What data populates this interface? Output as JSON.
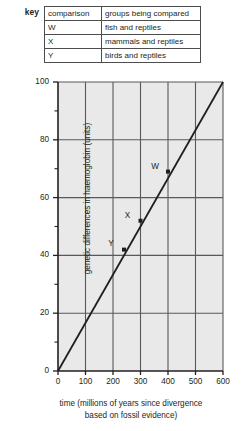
{
  "key": {
    "label": "key",
    "headers": [
      "comparison",
      "groups being compared"
    ],
    "rows": [
      {
        "comparison": "W",
        "groups": "fish and reptiles"
      },
      {
        "comparison": "X",
        "groups": "mammals and reptiles"
      },
      {
        "comparison": "Y",
        "groups": "birds and reptiles"
      }
    ]
  },
  "chart_data": {
    "type": "line",
    "title": "",
    "xlabel": "time (millions of years since divergence based on fossil evidence)",
    "xlabel_line1": "time (millions of years since divergence",
    "xlabel_line2": "based on fossil evidence)",
    "ylabel": "genetic differences in haemoglobin (units)",
    "xlim": [
      0,
      600
    ],
    "ylim": [
      0,
      100
    ],
    "xticks": [
      0,
      100,
      200,
      300,
      400,
      500,
      600
    ],
    "yticks": [
      0,
      20,
      40,
      60,
      80,
      100
    ],
    "y_minor_ticks": [
      10,
      30,
      50,
      70,
      90
    ],
    "grid": true,
    "legend_position": "above-plot",
    "series": [
      {
        "name": "best fit line",
        "x": [
          0,
          600
        ],
        "values": [
          0,
          100
        ]
      }
    ],
    "annotations": [
      {
        "label": "W",
        "x": 400,
        "y": 69,
        "label_offset_x": -13,
        "label_offset_y": -6
      },
      {
        "label": "X",
        "x": 300,
        "y": 52,
        "label_offset_x": -13,
        "label_offset_y": -6
      },
      {
        "label": "Y",
        "x": 240,
        "y": 42,
        "label_offset_x": -13,
        "label_offset_y": -7
      }
    ],
    "colors": {
      "plot_background": "#e9e9e9",
      "gridline": "#59595b",
      "axis": "#231f20",
      "line": "#231f20",
      "marker": "#231f20"
    }
  }
}
